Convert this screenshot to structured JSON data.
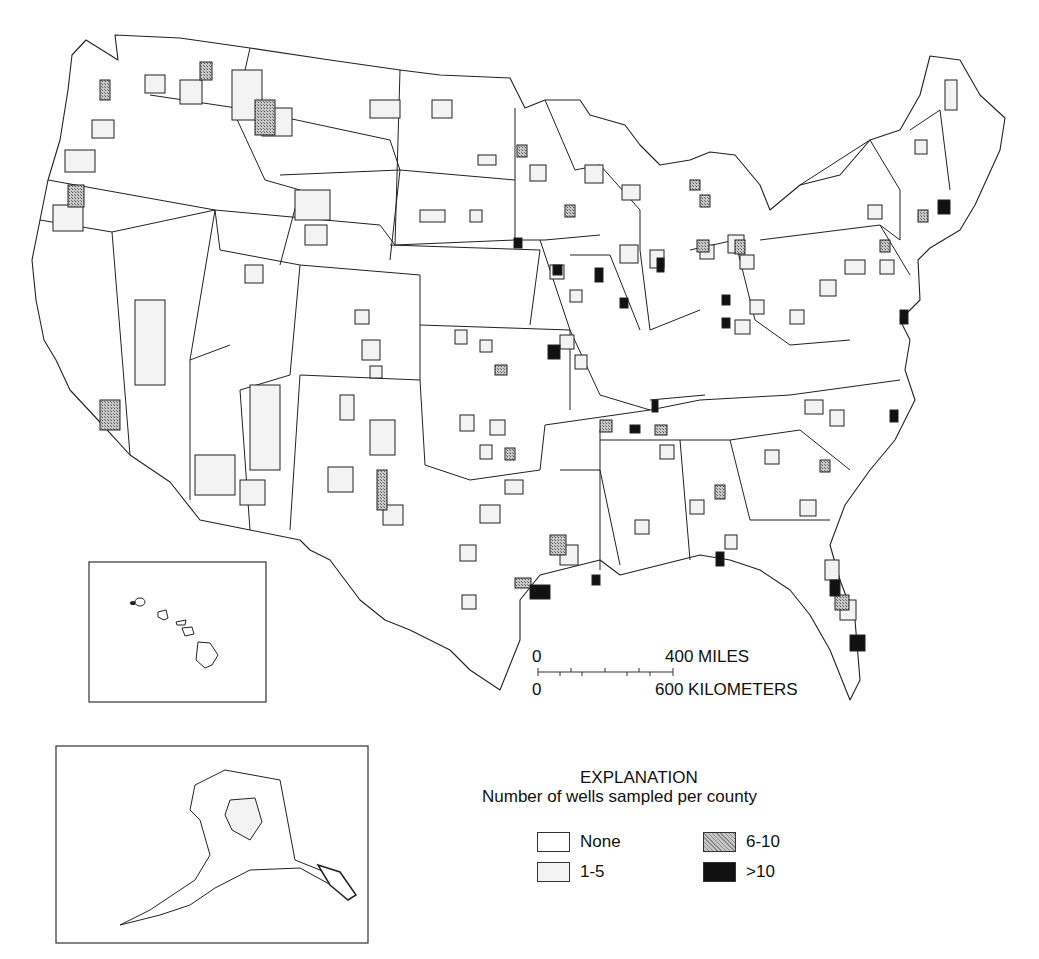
{
  "map": {
    "title": "Number of wells sampled per county",
    "colors": {
      "none": "#ffffff",
      "low": "#f3f3f3",
      "mid": "#9a9a9a",
      "high": "#111111",
      "outline": "#222222"
    }
  },
  "scale_bar": {
    "miles_zero": "0",
    "miles_label": "400 MILES",
    "km_zero": "0",
    "km_label": "600 KILOMETERS"
  },
  "legend": {
    "heading": "EXPLANATION",
    "subtitle": "Number of wells sampled per county",
    "items": [
      {
        "label": "None",
        "class": "none"
      },
      {
        "label": "1-5",
        "class": "low"
      },
      {
        "label": "6-10",
        "class": "mid"
      },
      {
        "label": ">10",
        "class": "high"
      }
    ]
  },
  "insets": [
    {
      "name": "Hawaii"
    },
    {
      "name": "Alaska"
    }
  ]
}
